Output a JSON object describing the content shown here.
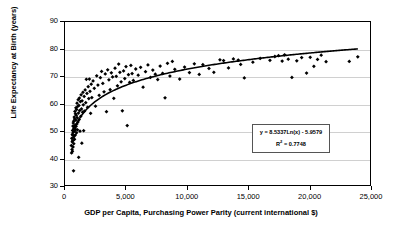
{
  "chart_data": {
    "type": "scatter",
    "title": "",
    "xlabel": "GDP per Capita, Purchasing Power Parity (current international $)",
    "ylabel": "Life Expectancy at Birth (years)",
    "xlim": [
      0,
      25000
    ],
    "ylim": [
      30,
      90
    ],
    "xticks": [
      0,
      5000,
      10000,
      15000,
      20000,
      25000
    ],
    "xtick_labels": [
      "0",
      "5,000",
      "10,000",
      "15,000",
      "20,000",
      "25,000"
    ],
    "yticks": [
      30,
      40,
      50,
      60,
      70,
      80,
      90
    ],
    "ytick_labels": [
      "30",
      "40",
      "50",
      "60",
      "70",
      "80",
      "90"
    ],
    "grid": "horizontal",
    "legend": "none",
    "marker": "diamond",
    "marker_color": "#000000",
    "trendline": {
      "type": "logarithmic",
      "coefficient": 8.5337,
      "intercept": -5.9579,
      "r_squared": 0.7748,
      "color": "#000000",
      "equation_label": "y = 8.5337Ln(x) - 5.9579",
      "r2_prefix": "R",
      "r2_exponent": "2",
      "r2_value": " = 0.7748"
    },
    "points": [
      [
        520,
        44.5
      ],
      [
        540,
        41.8
      ],
      [
        560,
        47.2
      ],
      [
        575,
        43.1
      ],
      [
        590,
        45.9
      ],
      [
        600,
        48.6
      ],
      [
        610,
        42.4
      ],
      [
        620,
        50.1
      ],
      [
        635,
        46.3
      ],
      [
        650,
        51.7
      ],
      [
        660,
        44.0
      ],
      [
        670,
        49.4
      ],
      [
        680,
        52.8
      ],
      [
        690,
        47.6
      ],
      [
        700,
        35.2
      ],
      [
        710,
        53.5
      ],
      [
        720,
        45.2
      ],
      [
        730,
        50.8
      ],
      [
        745,
        48.1
      ],
      [
        760,
        55.0
      ],
      [
        770,
        51.2
      ],
      [
        780,
        46.8
      ],
      [
        790,
        54.3
      ],
      [
        800,
        49.9
      ],
      [
        815,
        57.1
      ],
      [
        825,
        52.0
      ],
      [
        840,
        48.4
      ],
      [
        855,
        56.2
      ],
      [
        870,
        50.5
      ],
      [
        880,
        53.9
      ],
      [
        895,
        58.4
      ],
      [
        910,
        51.6
      ],
      [
        925,
        55.7
      ],
      [
        940,
        49.2
      ],
      [
        955,
        57.8
      ],
      [
        970,
        52.5
      ],
      [
        985,
        60.1
      ],
      [
        1000,
        54.8
      ],
      [
        1020,
        50.3
      ],
      [
        1040,
        58.9
      ],
      [
        1060,
        53.2
      ],
      [
        1080,
        61.4
      ],
      [
        1100,
        56.5
      ],
      [
        1120,
        40.2
      ],
      [
        1140,
        59.3
      ],
      [
        1160,
        54.1
      ],
      [
        1180,
        62.0
      ],
      [
        1200,
        57.4
      ],
      [
        1230,
        49.8
      ],
      [
        1260,
        60.7
      ],
      [
        1290,
        55.3
      ],
      [
        1320,
        63.2
      ],
      [
        1350,
        58.0
      ],
      [
        1380,
        45.4
      ],
      [
        1400,
        61.0
      ],
      [
        1440,
        56.8
      ],
      [
        1470,
        64.1
      ],
      [
        1500,
        59.5
      ],
      [
        1530,
        50.0
      ],
      [
        1570,
        62.6
      ],
      [
        1600,
        57.2
      ],
      [
        1650,
        65.0
      ],
      [
        1700,
        60.3
      ],
      [
        1750,
        68.9
      ],
      [
        1800,
        63.7
      ],
      [
        1850,
        58.6
      ],
      [
        1900,
        66.2
      ],
      [
        1950,
        61.8
      ],
      [
        2000,
        69.0
      ],
      [
        2050,
        64.5
      ],
      [
        2100,
        56.4
      ],
      [
        2150,
        67.1
      ],
      [
        2200,
        62.2
      ],
      [
        2300,
        68.3
      ],
      [
        2400,
        65.6
      ],
      [
        2500,
        59.0
      ],
      [
        2600,
        70.2
      ],
      [
        2700,
        66.8
      ],
      [
        2800,
        63.0
      ],
      [
        2900,
        69.5
      ],
      [
        3000,
        71.8
      ],
      [
        3100,
        67.4
      ],
      [
        3200,
        64.3
      ],
      [
        3300,
        70.9
      ],
      [
        3400,
        57.0
      ],
      [
        3500,
        72.4
      ],
      [
        3600,
        68.7
      ],
      [
        3700,
        65.1
      ],
      [
        3800,
        71.3
      ],
      [
        3900,
        69.8
      ],
      [
        4000,
        61.9
      ],
      [
        4100,
        73.0
      ],
      [
        4200,
        70.0
      ],
      [
        4300,
        66.5
      ],
      [
        4400,
        74.5
      ],
      [
        4500,
        71.5
      ],
      [
        4600,
        68.0
      ],
      [
        4700,
        57.3
      ],
      [
        4800,
        72.0
      ],
      [
        4900,
        69.2
      ],
      [
        5000,
        73.6
      ],
      [
        5100,
        51.9
      ],
      [
        5200,
        70.6
      ],
      [
        5300,
        67.8
      ],
      [
        5400,
        74.0
      ],
      [
        5500,
        71.0
      ],
      [
        5600,
        68.5
      ],
      [
        5800,
        72.7
      ],
      [
        6000,
        70.4
      ],
      [
        6200,
        73.3
      ],
      [
        6400,
        66.0
      ],
      [
        6600,
        71.7
      ],
      [
        6800,
        74.2
      ],
      [
        7000,
        69.6
      ],
      [
        7200,
        72.3
      ],
      [
        7400,
        70.8
      ],
      [
        7600,
        68.8
      ],
      [
        7800,
        73.8
      ],
      [
        8000,
        71.1
      ],
      [
        8200,
        62.1
      ],
      [
        8400,
        74.8
      ],
      [
        8600,
        70.1
      ],
      [
        8800,
        75.5
      ],
      [
        9000,
        72.6
      ],
      [
        9400,
        69.0
      ],
      [
        9800,
        73.4
      ],
      [
        10200,
        71.4
      ],
      [
        10600,
        74.6
      ],
      [
        11000,
        70.7
      ],
      [
        11300,
        74.3
      ],
      [
        11800,
        72.9
      ],
      [
        12200,
        71.5
      ],
      [
        12700,
        76.1
      ],
      [
        13000,
        75.8
      ],
      [
        13400,
        73.1
      ],
      [
        13800,
        76.4
      ],
      [
        14200,
        76.0
      ],
      [
        14400,
        74.4
      ],
      [
        14700,
        69.4
      ],
      [
        15400,
        75.2
      ],
      [
        16000,
        76.6
      ],
      [
        16800,
        75.9
      ],
      [
        17200,
        77.3
      ],
      [
        17500,
        77.6
      ],
      [
        17800,
        75.6
      ],
      [
        18000,
        77.9
      ],
      [
        18300,
        76.3
      ],
      [
        18600,
        69.6
      ],
      [
        19000,
        75.7
      ],
      [
        19400,
        76.9
      ],
      [
        19800,
        71.2
      ],
      [
        20100,
        77.0
      ],
      [
        20400,
        73.7
      ],
      [
        20700,
        76.2
      ],
      [
        21000,
        77.8
      ],
      [
        21400,
        75.4
      ],
      [
        23300,
        75.5
      ],
      [
        24000,
        77.2
      ]
    ]
  }
}
